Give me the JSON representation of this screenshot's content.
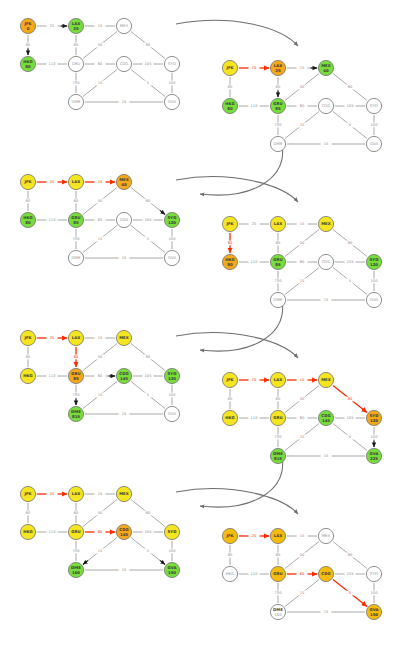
{
  "figure": {
    "caption": "",
    "panel_count": 8,
    "colors": {
      "visited": "#78dd3c",
      "current": "#f5a81c",
      "frontier": "#f5e520",
      "final_path": "#f5bc0d",
      "unvisited": "#ffffff",
      "node_stroke": "#6b6b6b",
      "edge": "#8c8c8c",
      "relax_edge": "#fa2a00",
      "flow_arrow": "#6e6e6e"
    },
    "legend": {
      "visited_label": "visited",
      "current_label": "current",
      "frontier_label": "frontier / tentative",
      "unvisited_label": "unvisited",
      "final_label": "final shortest path"
    }
  },
  "graph": {
    "nodes": [
      "JFK",
      "LAX",
      "MEX",
      "HKG",
      "GRU",
      "CDG",
      "SYD",
      "DME",
      "GVA"
    ],
    "node_positions": {
      "JFK": [
        14,
        12
      ],
      "LAX": [
        62,
        12
      ],
      "MEX": [
        110,
        12
      ],
      "HKG": [
        14,
        50
      ],
      "GRU": [
        62,
        50
      ],
      "CDG": [
        110,
        50
      ],
      "SYD": [
        158,
        50
      ],
      "DME": [
        62,
        88
      ],
      "GVA": [
        158,
        88
      ]
    },
    "edges": [
      {
        "from": "JFK",
        "to": "LAX",
        "weight": 25
      },
      {
        "from": "LAX",
        "to": "MEX",
        "weight": 15
      },
      {
        "from": "JFK",
        "to": "HKG",
        "weight": 80
      },
      {
        "from": "LAX",
        "to": "GRU",
        "weight": 60
      },
      {
        "from": "MEX",
        "to": "GRU",
        "weight": 50
      },
      {
        "from": "MEX",
        "to": "SYD",
        "weight": 80
      },
      {
        "from": "HKG",
        "to": "GRU",
        "weight": 110
      },
      {
        "from": "GRU",
        "to": "CDG",
        "weight": 60
      },
      {
        "from": "CDG",
        "to": "SYD",
        "weight": 105
      },
      {
        "from": "GRU",
        "to": "DME",
        "weight": 730
      },
      {
        "from": "CDG",
        "to": "DME",
        "weight": 15
      },
      {
        "from": "CDG",
        "to": "GVA",
        "weight": 5
      },
      {
        "from": "SYD",
        "to": "GVA",
        "weight": 100
      },
      {
        "from": "DME",
        "to": "GVA",
        "weight": 15
      }
    ]
  },
  "panels": [
    {
      "id": "panel-1",
      "step": 1,
      "origin": [
        14,
        14
      ],
      "current_node": "JFK",
      "node_states": {
        "JFK": {
          "dist": "0",
          "state": "current"
        },
        "LAX": {
          "dist": "25",
          "state": "visited"
        },
        "MEX": {
          "dist": "",
          "state": "unvisited"
        },
        "HKG": {
          "dist": "80",
          "state": "visited"
        },
        "GRU": {
          "dist": "",
          "state": "unvisited"
        },
        "CDG": {
          "dist": "",
          "state": "unvisited"
        },
        "SYD": {
          "dist": "",
          "state": "unvisited"
        },
        "DME": {
          "dist": "",
          "state": "unvisited"
        },
        "GVA": {
          "dist": "",
          "state": "unvisited"
        }
      },
      "hot_edges": [],
      "relax_arrows": [
        [
          "JFK",
          "LAX"
        ],
        [
          "JFK",
          "HKG"
        ]
      ]
    },
    {
      "id": "panel-2",
      "step": 2,
      "origin": [
        216,
        56
      ],
      "current_node": "LAX",
      "node_states": {
        "JFK": {
          "dist": "",
          "state": "frontier"
        },
        "LAX": {
          "dist": "25",
          "state": "current"
        },
        "MEX": {
          "dist": "40",
          "state": "visited"
        },
        "HKG": {
          "dist": "80",
          "state": "visited"
        },
        "GRU": {
          "dist": "85",
          "state": "visited"
        },
        "CDG": {
          "dist": "",
          "state": "unvisited"
        },
        "SYD": {
          "dist": "",
          "state": "unvisited"
        },
        "DME": {
          "dist": "",
          "state": "unvisited"
        },
        "GVA": {
          "dist": "",
          "state": "unvisited"
        }
      },
      "hot_edges": [
        [
          "JFK",
          "LAX"
        ]
      ],
      "relax_arrows": [
        [
          "LAX",
          "MEX"
        ],
        [
          "LAX",
          "GRU"
        ]
      ]
    },
    {
      "id": "panel-3",
      "step": 3,
      "origin": [
        14,
        170
      ],
      "current_node": "MEX",
      "node_states": {
        "JFK": {
          "dist": "",
          "state": "frontier"
        },
        "LAX": {
          "dist": "",
          "state": "frontier"
        },
        "MEX": {
          "dist": "40",
          "state": "current"
        },
        "HKG": {
          "dist": "80",
          "state": "visited"
        },
        "GRU": {
          "dist": "85",
          "state": "visited"
        },
        "CDG": {
          "dist": "",
          "state": "unvisited"
        },
        "SYD": {
          "dist": "120",
          "state": "visited"
        },
        "DME": {
          "dist": "",
          "state": "unvisited"
        },
        "GVA": {
          "dist": "",
          "state": "unvisited"
        }
      },
      "hot_edges": [
        [
          "JFK",
          "LAX"
        ],
        [
          "LAX",
          "MEX"
        ]
      ],
      "relax_arrows": [
        [
          "MEX",
          "SYD"
        ]
      ]
    },
    {
      "id": "panel-4",
      "step": 4,
      "origin": [
        216,
        212
      ],
      "current_node": "HKG",
      "node_states": {
        "JFK": {
          "dist": "",
          "state": "frontier"
        },
        "LAX": {
          "dist": "",
          "state": "frontier"
        },
        "MEX": {
          "dist": "",
          "state": "frontier"
        },
        "HKG": {
          "dist": "80",
          "state": "current"
        },
        "GRU": {
          "dist": "85",
          "state": "visited"
        },
        "CDG": {
          "dist": "",
          "state": "unvisited"
        },
        "SYD": {
          "dist": "120",
          "state": "visited"
        },
        "DME": {
          "dist": "",
          "state": "unvisited"
        },
        "GVA": {
          "dist": "",
          "state": "unvisited"
        }
      },
      "hot_edges": [
        [
          "JFK",
          "HKG"
        ]
      ],
      "relax_arrows": []
    },
    {
      "id": "panel-5",
      "step": 5,
      "origin": [
        14,
        326
      ],
      "current_node": "GRU",
      "node_states": {
        "JFK": {
          "dist": "",
          "state": "frontier"
        },
        "LAX": {
          "dist": "",
          "state": "frontier"
        },
        "MEX": {
          "dist": "",
          "state": "frontier"
        },
        "HKG": {
          "dist": "",
          "state": "frontier"
        },
        "GRU": {
          "dist": "85",
          "state": "current"
        },
        "CDG": {
          "dist": "145",
          "state": "visited"
        },
        "SYD": {
          "dist": "120",
          "state": "visited"
        },
        "DME": {
          "dist": "815",
          "state": "visited"
        },
        "GVA": {
          "dist": "",
          "state": "unvisited"
        }
      },
      "hot_edges": [
        [
          "JFK",
          "LAX"
        ],
        [
          "LAX",
          "GRU"
        ]
      ],
      "relax_arrows": [
        [
          "GRU",
          "CDG"
        ],
        [
          "GRU",
          "DME"
        ]
      ]
    },
    {
      "id": "panel-6",
      "step": 6,
      "origin": [
        216,
        368
      ],
      "current_node": "SYD",
      "node_states": {
        "JFK": {
          "dist": "",
          "state": "frontier"
        },
        "LAX": {
          "dist": "",
          "state": "frontier"
        },
        "MEX": {
          "dist": "",
          "state": "frontier"
        },
        "HKG": {
          "dist": "",
          "state": "frontier"
        },
        "GRU": {
          "dist": "",
          "state": "frontier"
        },
        "CDG": {
          "dist": "145",
          "state": "visited"
        },
        "SYD": {
          "dist": "120",
          "state": "current"
        },
        "DME": {
          "dist": "815",
          "state": "visited"
        },
        "GVA": {
          "dist": "225",
          "state": "visited"
        }
      },
      "hot_edges": [
        [
          "JFK",
          "LAX"
        ],
        [
          "LAX",
          "MEX"
        ],
        [
          "MEX",
          "SYD"
        ]
      ],
      "relax_arrows": [
        [
          "SYD",
          "GVA"
        ]
      ]
    },
    {
      "id": "panel-7",
      "step": 7,
      "origin": [
        14,
        482
      ],
      "current_node": "CDG",
      "node_states": {
        "JFK": {
          "dist": "",
          "state": "frontier"
        },
        "LAX": {
          "dist": "",
          "state": "frontier"
        },
        "MEX": {
          "dist": "",
          "state": "frontier"
        },
        "HKG": {
          "dist": "",
          "state": "frontier"
        },
        "GRU": {
          "dist": "",
          "state": "frontier"
        },
        "CDG": {
          "dist": "145",
          "state": "current"
        },
        "SYD": {
          "dist": "",
          "state": "frontier"
        },
        "DME": {
          "dist": "160",
          "state": "visited"
        },
        "GVA": {
          "dist": "150",
          "state": "visited"
        }
      },
      "hot_edges": [
        [
          "JFK",
          "LAX"
        ],
        [
          "GRU",
          "CDG"
        ]
      ],
      "relax_arrows": [
        [
          "CDG",
          "DME"
        ],
        [
          "CDG",
          "GVA"
        ]
      ]
    },
    {
      "id": "panel-8",
      "step": 8,
      "origin": [
        216,
        524
      ],
      "current_node": "GVA",
      "node_states": {
        "JFK": {
          "dist": "",
          "state": "final"
        },
        "LAX": {
          "dist": "",
          "state": "final"
        },
        "MEX": {
          "dist": "",
          "state": "unvisited"
        },
        "HKG": {
          "dist": "",
          "state": "unvisited"
        },
        "GRU": {
          "dist": "",
          "state": "final"
        },
        "CDG": {
          "dist": "",
          "state": "final"
        },
        "SYD": {
          "dist": "",
          "state": "unvisited"
        },
        "DME": {
          "dist": "160",
          "state": "unvisited"
        },
        "GVA": {
          "dist": "150",
          "state": "final"
        }
      },
      "hot_edges": [
        [
          "JFK",
          "LAX"
        ],
        [
          "GRU",
          "CDG"
        ],
        [
          "CDG",
          "GVA"
        ]
      ],
      "relax_arrows": []
    }
  ],
  "flow_arrows": [
    {
      "from_panel": 1,
      "to_panel": 2,
      "path": "M 176 24 C 230 14 280 26 298 46"
    },
    {
      "from_panel": 2,
      "to_panel": 3,
      "path": "M 282 144 C 288 180 250 200 200 194"
    },
    {
      "from_panel": 3,
      "to_panel": 4,
      "path": "M 176 180 C 230 170 282 184 298 202"
    },
    {
      "from_panel": 4,
      "to_panel": 5,
      "path": "M 282 300 C 288 336 250 356 200 350"
    },
    {
      "from_panel": 5,
      "to_panel": 6,
      "path": "M 176 336 C 230 326 282 340 298 358"
    },
    {
      "from_panel": 6,
      "to_panel": 7,
      "path": "M 282 456 C 288 492 250 512 200 506"
    },
    {
      "from_panel": 7,
      "to_panel": 8,
      "path": "M 176 492 C 230 482 282 496 298 514"
    }
  ]
}
